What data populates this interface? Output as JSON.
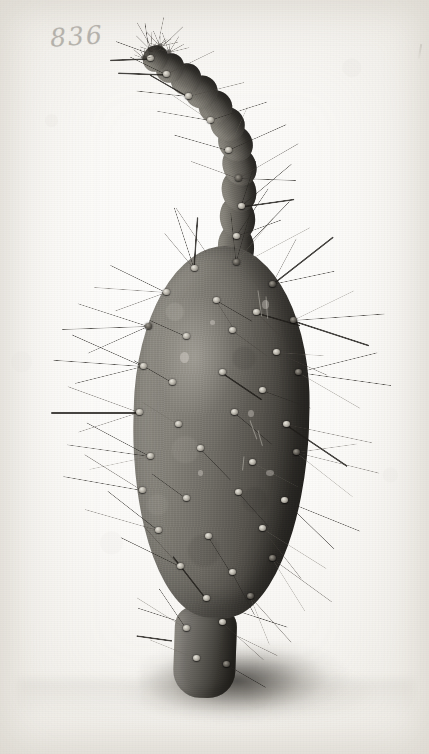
{
  "plate": {
    "medium": "monochrome photographic plate",
    "subject": "spiny cactus plant",
    "catalog_number": "836",
    "background_color": "#fbfaf8",
    "ink_color": "#2a2825"
  },
  "specimen": {
    "pad_label": "oval cactus pad",
    "terminal_stem_label": "curved terminal stem segment",
    "basal_stem_label": "basal stem",
    "shadow_label": "cast shadow",
    "body_dark": "#26241f",
    "body_mid": "#6f6c65",
    "body_light": "#8b8880",
    "spine_color": "#2a2824"
  },
  "geometry": {
    "pad": {
      "left": 133,
      "top": 246,
      "width": 176,
      "height": 372
    },
    "base_stem": {
      "left": 174,
      "top": 606,
      "width": 62,
      "height": 92
    },
    "shadow": {
      "left": 140,
      "top": 640,
      "width": 230,
      "height": 86
    },
    "stem_segments": [
      {
        "left": 218,
        "top": 224,
        "width": 36,
        "height": 46,
        "rot": -6
      },
      {
        "left": 220,
        "top": 196,
        "width": 35,
        "height": 44,
        "rot": -10
      },
      {
        "left": 222,
        "top": 170,
        "width": 34,
        "height": 42,
        "rot": -16
      },
      {
        "left": 223,
        "top": 146,
        "width": 33,
        "height": 40,
        "rot": -24
      },
      {
        "left": 219,
        "top": 124,
        "width": 33,
        "height": 38,
        "rot": -34
      },
      {
        "left": 211,
        "top": 106,
        "width": 33,
        "height": 36,
        "rot": -44
      },
      {
        "left": 199,
        "top": 90,
        "width": 33,
        "height": 34,
        "rot": -52
      },
      {
        "left": 185,
        "top": 76,
        "width": 33,
        "height": 32,
        "rot": -58
      },
      {
        "left": 170,
        "top": 64,
        "width": 32,
        "height": 30,
        "rot": -62
      },
      {
        "left": 155,
        "top": 54,
        "width": 30,
        "height": 28,
        "rot": -64
      },
      {
        "left": 142,
        "top": 46,
        "width": 27,
        "height": 25,
        "rot": -62
      }
    ],
    "areoles": [
      {
        "x": 194,
        "y": 268,
        "dark": false
      },
      {
        "x": 236,
        "y": 262,
        "dark": true
      },
      {
        "x": 272,
        "y": 284,
        "dark": true
      },
      {
        "x": 166,
        "y": 292,
        "dark": false
      },
      {
        "x": 216,
        "y": 300,
        "dark": false
      },
      {
        "x": 256,
        "y": 312,
        "dark": false
      },
      {
        "x": 293,
        "y": 320,
        "dark": true
      },
      {
        "x": 148,
        "y": 326,
        "dark": true
      },
      {
        "x": 186,
        "y": 336,
        "dark": false
      },
      {
        "x": 232,
        "y": 330,
        "dark": false
      },
      {
        "x": 276,
        "y": 352,
        "dark": false
      },
      {
        "x": 143,
        "y": 366,
        "dark": false
      },
      {
        "x": 172,
        "y": 382,
        "dark": false
      },
      {
        "x": 222,
        "y": 372,
        "dark": false
      },
      {
        "x": 262,
        "y": 390,
        "dark": false
      },
      {
        "x": 298,
        "y": 372,
        "dark": true
      },
      {
        "x": 139,
        "y": 412,
        "dark": false
      },
      {
        "x": 178,
        "y": 424,
        "dark": false
      },
      {
        "x": 234,
        "y": 412,
        "dark": false
      },
      {
        "x": 286,
        "y": 424,
        "dark": false
      },
      {
        "x": 150,
        "y": 456,
        "dark": false
      },
      {
        "x": 200,
        "y": 448,
        "dark": false
      },
      {
        "x": 252,
        "y": 462,
        "dark": false
      },
      {
        "x": 296,
        "y": 452,
        "dark": true
      },
      {
        "x": 142,
        "y": 490,
        "dark": false
      },
      {
        "x": 186,
        "y": 498,
        "dark": false
      },
      {
        "x": 238,
        "y": 492,
        "dark": false
      },
      {
        "x": 284,
        "y": 500,
        "dark": false
      },
      {
        "x": 158,
        "y": 530,
        "dark": false
      },
      {
        "x": 208,
        "y": 536,
        "dark": false
      },
      {
        "x": 262,
        "y": 528,
        "dark": false
      },
      {
        "x": 180,
        "y": 566,
        "dark": false
      },
      {
        "x": 232,
        "y": 572,
        "dark": false
      },
      {
        "x": 272,
        "y": 558,
        "dark": true
      },
      {
        "x": 206,
        "y": 598,
        "dark": false
      },
      {
        "x": 250,
        "y": 596,
        "dark": true
      },
      {
        "x": 186,
        "y": 628,
        "dark": false
      },
      {
        "x": 222,
        "y": 622,
        "dark": false
      },
      {
        "x": 196,
        "y": 658,
        "dark": false
      },
      {
        "x": 226,
        "y": 664,
        "dark": true
      },
      {
        "x": 236,
        "y": 236,
        "dark": false
      },
      {
        "x": 241,
        "y": 206,
        "dark": false
      },
      {
        "x": 238,
        "y": 178,
        "dark": true
      },
      {
        "x": 228,
        "y": 150,
        "dark": false
      },
      {
        "x": 210,
        "y": 120,
        "dark": false
      },
      {
        "x": 188,
        "y": 96,
        "dark": false
      },
      {
        "x": 166,
        "y": 74,
        "dark": false
      },
      {
        "x": 150,
        "y": 58,
        "dark": false
      }
    ],
    "spines": [
      {
        "x": 194,
        "y": 268,
        "len": 64,
        "ang": -108
      },
      {
        "x": 194,
        "y": 268,
        "len": 52,
        "ang": -86
      },
      {
        "x": 194,
        "y": 268,
        "len": 46,
        "ang": -130
      },
      {
        "x": 236,
        "y": 262,
        "len": 70,
        "ang": -74
      },
      {
        "x": 236,
        "y": 262,
        "len": 58,
        "ang": -50
      },
      {
        "x": 236,
        "y": 262,
        "len": 50,
        "ang": -96
      },
      {
        "x": 272,
        "y": 284,
        "len": 78,
        "ang": -38
      },
      {
        "x": 272,
        "y": 284,
        "len": 64,
        "ang": -12
      },
      {
        "x": 272,
        "y": 284,
        "len": 52,
        "ang": -62
      },
      {
        "x": 166,
        "y": 292,
        "len": 72,
        "ang": 184
      },
      {
        "x": 166,
        "y": 292,
        "len": 62,
        "ang": 206
      },
      {
        "x": 166,
        "y": 292,
        "len": 54,
        "ang": 160
      },
      {
        "x": 216,
        "y": 300,
        "len": 42,
        "ang": 30
      },
      {
        "x": 216,
        "y": 300,
        "len": 36,
        "ang": 58
      },
      {
        "x": 256,
        "y": 312,
        "len": 46,
        "ang": 16
      },
      {
        "x": 256,
        "y": 312,
        "len": 40,
        "ang": 44
      },
      {
        "x": 293,
        "y": 320,
        "len": 92,
        "ang": -4
      },
      {
        "x": 293,
        "y": 320,
        "len": 80,
        "ang": 18
      },
      {
        "x": 293,
        "y": 320,
        "len": 68,
        "ang": -26
      },
      {
        "x": 148,
        "y": 326,
        "len": 86,
        "ang": 178
      },
      {
        "x": 148,
        "y": 326,
        "len": 74,
        "ang": 198
      },
      {
        "x": 148,
        "y": 326,
        "len": 66,
        "ang": 156
      },
      {
        "x": 186,
        "y": 336,
        "len": 40,
        "ang": 204
      },
      {
        "x": 232,
        "y": 330,
        "len": 44,
        "ang": 36
      },
      {
        "x": 276,
        "y": 352,
        "len": 56,
        "ang": 24
      },
      {
        "x": 276,
        "y": 352,
        "len": 48,
        "ang": 4
      },
      {
        "x": 143,
        "y": 366,
        "len": 90,
        "ang": 184
      },
      {
        "x": 143,
        "y": 366,
        "len": 78,
        "ang": 204
      },
      {
        "x": 143,
        "y": 366,
        "len": 70,
        "ang": 166
      },
      {
        "x": 172,
        "y": 382,
        "len": 44,
        "ang": 210
      },
      {
        "x": 222,
        "y": 372,
        "len": 48,
        "ang": 34
      },
      {
        "x": 262,
        "y": 390,
        "len": 52,
        "ang": 20
      },
      {
        "x": 298,
        "y": 372,
        "len": 94,
        "ang": 8
      },
      {
        "x": 298,
        "y": 372,
        "len": 82,
        "ang": -14
      },
      {
        "x": 298,
        "y": 372,
        "len": 72,
        "ang": 30
      },
      {
        "x": 139,
        "y": 412,
        "len": 88,
        "ang": 180
      },
      {
        "x": 139,
        "y": 412,
        "len": 76,
        "ang": 200
      },
      {
        "x": 139,
        "y": 412,
        "len": 64,
        "ang": 162
      },
      {
        "x": 178,
        "y": 424,
        "len": 42,
        "ang": 212
      },
      {
        "x": 234,
        "y": 412,
        "len": 50,
        "ang": 40
      },
      {
        "x": 286,
        "y": 424,
        "len": 88,
        "ang": 12
      },
      {
        "x": 286,
        "y": 424,
        "len": 74,
        "ang": 34
      },
      {
        "x": 150,
        "y": 456,
        "len": 84,
        "ang": 188
      },
      {
        "x": 150,
        "y": 456,
        "len": 72,
        "ang": 208
      },
      {
        "x": 150,
        "y": 456,
        "len": 62,
        "ang": 168
      },
      {
        "x": 200,
        "y": 448,
        "len": 44,
        "ang": 46
      },
      {
        "x": 252,
        "y": 462,
        "len": 52,
        "ang": 28
      },
      {
        "x": 296,
        "y": 452,
        "len": 86,
        "ang": 14
      },
      {
        "x": 296,
        "y": 452,
        "len": 72,
        "ang": 38
      },
      {
        "x": 296,
        "y": 452,
        "len": 62,
        "ang": -8
      },
      {
        "x": 142,
        "y": 490,
        "len": 80,
        "ang": 190
      },
      {
        "x": 142,
        "y": 490,
        "len": 68,
        "ang": 212
      },
      {
        "x": 186,
        "y": 498,
        "len": 42,
        "ang": 216
      },
      {
        "x": 238,
        "y": 492,
        "len": 46,
        "ang": 48
      },
      {
        "x": 284,
        "y": 500,
        "len": 82,
        "ang": 22
      },
      {
        "x": 284,
        "y": 500,
        "len": 70,
        "ang": 44
      },
      {
        "x": 158,
        "y": 530,
        "len": 76,
        "ang": 196
      },
      {
        "x": 158,
        "y": 530,
        "len": 64,
        "ang": 218
      },
      {
        "x": 208,
        "y": 536,
        "len": 44,
        "ang": 58
      },
      {
        "x": 262,
        "y": 528,
        "len": 76,
        "ang": 32
      },
      {
        "x": 262,
        "y": 528,
        "len": 64,
        "ang": 52
      },
      {
        "x": 180,
        "y": 566,
        "len": 66,
        "ang": 206
      },
      {
        "x": 180,
        "y": 566,
        "len": 56,
        "ang": 228
      },
      {
        "x": 232,
        "y": 572,
        "len": 48,
        "ang": 62
      },
      {
        "x": 272,
        "y": 558,
        "len": 74,
        "ang": 36
      },
      {
        "x": 272,
        "y": 558,
        "len": 62,
        "ang": 58
      },
      {
        "x": 206,
        "y": 598,
        "len": 54,
        "ang": 232
      },
      {
        "x": 250,
        "y": 596,
        "len": 62,
        "ang": 48
      },
      {
        "x": 250,
        "y": 596,
        "len": 52,
        "ang": 68
      },
      {
        "x": 186,
        "y": 628,
        "len": 58,
        "ang": 212
      },
      {
        "x": 186,
        "y": 628,
        "len": 48,
        "ang": 236
      },
      {
        "x": 222,
        "y": 622,
        "len": 56,
        "ang": 42
      },
      {
        "x": 196,
        "y": 658,
        "len": 50,
        "ang": 202
      },
      {
        "x": 226,
        "y": 664,
        "len": 46,
        "ang": 30
      },
      {
        "x": 236,
        "y": 236,
        "len": 58,
        "ang": -56
      },
      {
        "x": 236,
        "y": 236,
        "len": 48,
        "ang": -20
      },
      {
        "x": 241,
        "y": 206,
        "len": 66,
        "ang": -40
      },
      {
        "x": 241,
        "y": 206,
        "len": 54,
        "ang": -8
      },
      {
        "x": 241,
        "y": 206,
        "len": 48,
        "ang": -72
      },
      {
        "x": 238,
        "y": 178,
        "len": 70,
        "ang": -30
      },
      {
        "x": 238,
        "y": 178,
        "len": 58,
        "ang": 2
      },
      {
        "x": 238,
        "y": 178,
        "len": 50,
        "ang": 200
      },
      {
        "x": 228,
        "y": 150,
        "len": 64,
        "ang": -24
      },
      {
        "x": 228,
        "y": 150,
        "len": 56,
        "ang": 196
      },
      {
        "x": 228,
        "y": 150,
        "len": 48,
        "ang": -66
      },
      {
        "x": 210,
        "y": 120,
        "len": 60,
        "ang": -18
      },
      {
        "x": 210,
        "y": 120,
        "len": 54,
        "ang": 190
      },
      {
        "x": 210,
        "y": 120,
        "len": 46,
        "ang": 214
      },
      {
        "x": 188,
        "y": 96,
        "len": 58,
        "ang": -14
      },
      {
        "x": 188,
        "y": 96,
        "len": 52,
        "ang": 186
      },
      {
        "x": 188,
        "y": 96,
        "len": 44,
        "ang": 210
      },
      {
        "x": 166,
        "y": 74,
        "len": 54,
        "ang": -26
      },
      {
        "x": 166,
        "y": 74,
        "len": 48,
        "ang": 182
      },
      {
        "x": 166,
        "y": 74,
        "len": 40,
        "ang": 206
      },
      {
        "x": 150,
        "y": 58,
        "len": 46,
        "ang": -44
      },
      {
        "x": 150,
        "y": 58,
        "len": 40,
        "ang": 178
      },
      {
        "x": 150,
        "y": 58,
        "len": 36,
        "ang": -98
      },
      {
        "x": 152,
        "y": 48,
        "len": 30,
        "ang": -120
      },
      {
        "x": 158,
        "y": 44,
        "len": 28,
        "ang": -78
      },
      {
        "x": 146,
        "y": 52,
        "len": 32,
        "ang": 200
      },
      {
        "x": 248,
        "y": 244,
        "len": 60,
        "ang": -46
      },
      {
        "x": 252,
        "y": 258,
        "len": 66,
        "ang": -28
      },
      {
        "x": 206,
        "y": 252,
        "len": 54,
        "ang": -124
      },
      {
        "x": 176,
        "y": 620,
        "len": 40,
        "ang": 198
      },
      {
        "x": 172,
        "y": 640,
        "len": 36,
        "ang": 188
      },
      {
        "x": 238,
        "y": 636,
        "len": 44,
        "ang": 26
      },
      {
        "x": 242,
        "y": 612,
        "len": 48,
        "ang": 18
      }
    ],
    "blemishes": [
      {
        "x": 180,
        "y": 352,
        "w": 9,
        "h": 11
      },
      {
        "x": 210,
        "y": 320,
        "w": 5,
        "h": 5
      },
      {
        "x": 248,
        "y": 410,
        "w": 6,
        "h": 7
      },
      {
        "x": 262,
        "y": 300,
        "w": 7,
        "h": 9
      },
      {
        "x": 198,
        "y": 470,
        "w": 5,
        "h": 6
      },
      {
        "x": 266,
        "y": 470,
        "w": 8,
        "h": 6
      }
    ],
    "scratches": [
      {
        "x": 258,
        "y": 290,
        "len": 26,
        "ang": 82
      },
      {
        "x": 266,
        "y": 296,
        "len": 22,
        "ang": 86
      },
      {
        "x": 250,
        "y": 420,
        "len": 20,
        "ang": 70
      },
      {
        "x": 258,
        "y": 430,
        "len": 16,
        "ang": 74
      },
      {
        "x": 244,
        "y": 456,
        "len": 14,
        "ang": 96
      }
    ]
  }
}
